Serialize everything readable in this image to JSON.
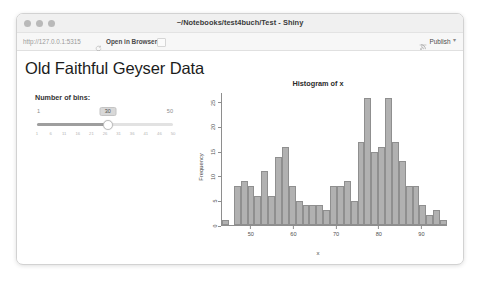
{
  "window": {
    "title": "~/Notebooks/test4buch/Test - Shiny",
    "traffic_lights": [
      "close",
      "minimize",
      "maximize"
    ]
  },
  "toolbar": {
    "url": "http://127.0.0.1:5315",
    "refresh_icon": "refresh-icon",
    "open_in_browser": "Open in Browser",
    "publish_label": "Publish",
    "publish_icon": "publish-icon",
    "publish_caret": "▾"
  },
  "app": {
    "page_title": "Old Faithful Geyser Data",
    "slider": {
      "label": "Number of bins:",
      "value": "30",
      "min": "1",
      "max": "50",
      "fill_percent": 52,
      "ticks": [
        "1",
        "6",
        "11",
        "16",
        "21",
        "26",
        "31",
        "36",
        "41",
        "46",
        "50"
      ]
    }
  },
  "chart_data": {
    "type": "bar",
    "title": "Histogram of x",
    "xlabel": "x",
    "ylabel": "Frequency",
    "bins": 30,
    "xlim": [
      43,
      96
    ],
    "ylim": [
      0,
      27
    ],
    "yticks": [
      0,
      5,
      10,
      15,
      20,
      25
    ],
    "xticks": [
      50,
      60,
      70,
      80,
      90
    ],
    "grid": false,
    "legend": false,
    "bin_centers": [
      44,
      45.8,
      47.6,
      49.4,
      51.2,
      53,
      54.8,
      56.6,
      58.4,
      60.2,
      62,
      63.8,
      65.6,
      67.4,
      69.2,
      71,
      72.8,
      74.6,
      76.4,
      78.2,
      80,
      81.8,
      83.6,
      85.4,
      87.2,
      89,
      90.8,
      92.6,
      94.4,
      96.2
    ],
    "values": [
      1,
      0,
      8,
      9,
      8,
      6,
      11,
      6,
      14,
      16,
      8,
      5,
      4,
      4,
      4,
      3,
      8,
      8,
      9,
      5,
      17,
      26,
      15,
      16,
      26,
      17,
      13,
      8,
      8,
      4,
      2,
      3,
      1
    ]
  }
}
